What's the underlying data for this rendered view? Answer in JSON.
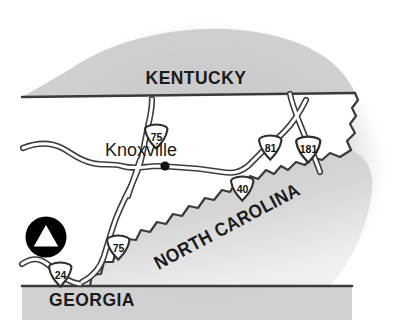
{
  "map": {
    "title": "Knoxville Tennessee regional highway location map",
    "colors": {
      "background": "#ffffff",
      "land_fill": "#ffffff",
      "shadow_gray": "#cfcfcf",
      "shadow_gray_mid": "#d9d9d9",
      "shadow_gray_light": "#eaeaea",
      "outline": "#3a3a3a",
      "road_casing": "#3d3d3d",
      "road_fill": "#ffffff",
      "text": "#1a1a1a",
      "marker_fill": "#000000",
      "marker_glyph": "#ffffff"
    },
    "state_labels": [
      {
        "name": "kentucky",
        "text": "KENTUCKY",
        "x": 196,
        "y": 84,
        "rotate": 0
      },
      {
        "name": "north-carolina",
        "text": "NORTH CAROLINA",
        "x": 175,
        "y": 253,
        "rotate": -28
      },
      {
        "name": "georgia",
        "text": "GEORGIA",
        "x": 92,
        "y": 303,
        "rotate": 0
      }
    ],
    "cities": [
      {
        "name": "knoxville",
        "text": "Knoxville",
        "label_x": 141,
        "label_y": 154,
        "dot_x": 165,
        "dot_y": 166,
        "dot_r": 4.2
      }
    ],
    "shields": [
      {
        "name": "i-75-north",
        "route": "75",
        "x": 143,
        "y": 124,
        "w": 27,
        "h": 26
      },
      {
        "name": "i-81",
        "route": "81",
        "x": 257,
        "y": 135,
        "w": 27,
        "h": 26
      },
      {
        "name": "i-181",
        "route": "181",
        "x": 294,
        "y": 136,
        "w": 29,
        "h": 26
      },
      {
        "name": "i-40",
        "route": "40",
        "x": 229,
        "y": 176,
        "w": 27,
        "h": 26
      },
      {
        "name": "i-75-south",
        "route": "75",
        "x": 105,
        "y": 235,
        "w": 27,
        "h": 26
      },
      {
        "name": "i-24",
        "route": "24",
        "x": 47,
        "y": 262,
        "w": 27,
        "h": 26
      }
    ],
    "point_of_interest": {
      "name": "destination-marker",
      "glyph": "triangle",
      "x": 46,
      "y": 237,
      "r": 21
    },
    "borders": [
      {
        "name": "kentucky-tennessee-border"
      },
      {
        "name": "north-carolina-tennessee-border"
      },
      {
        "name": "georgia-tennessee-border"
      },
      {
        "name": "tennessee-east-border"
      }
    ],
    "roads": [
      {
        "name": "interstate-75-corridor"
      },
      {
        "name": "interstate-40-corridor"
      },
      {
        "name": "interstate-81-corridor"
      },
      {
        "name": "interstate-181-corridor"
      },
      {
        "name": "interstate-24-corridor"
      }
    ]
  }
}
